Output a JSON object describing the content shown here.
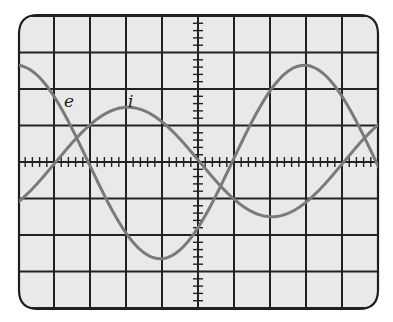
{
  "chart_data": {
    "type": "line",
    "title": "",
    "xlabel": "",
    "ylabel": "",
    "grid": true,
    "grid_divisions": {
      "x": 10,
      "y": 8
    },
    "xlim": [
      -5,
      5
    ],
    "ylim": [
      -4,
      4
    ],
    "units": "oscilloscope divisions",
    "annotations": [
      {
        "text": "e",
        "x": -3.5,
        "y": 1.6
      },
      {
        "text": "i",
        "x": -1.8,
        "y": 1.6
      }
    ],
    "series": [
      {
        "name": "e",
        "description": "voltage waveform, sinusoid",
        "amplitude_div": 2.65,
        "period_div": 8.0,
        "peak_x_div": 2.95,
        "points": [
          [
            -5.0,
            2.6
          ],
          [
            -4.0,
            1.85
          ],
          [
            -3.0,
            0.0
          ],
          [
            -2.0,
            -1.85
          ],
          [
            -1.05,
            -2.65
          ],
          [
            0.0,
            -1.85
          ],
          [
            1.0,
            0.0
          ],
          [
            2.0,
            1.85
          ],
          [
            2.95,
            2.65
          ],
          [
            4.0,
            1.85
          ],
          [
            5.0,
            0.0
          ]
        ],
        "color": "#7a7a7a"
      },
      {
        "name": "i",
        "description": "current waveform, sinusoid leading e by ~90°",
        "amplitude_div": 1.5,
        "period_div": 8.0,
        "peak_x_div": -1.95,
        "points": [
          [
            -5.0,
            -1.2
          ],
          [
            -4.0,
            0.0
          ],
          [
            -3.0,
            1.05
          ],
          [
            -1.95,
            1.5
          ],
          [
            -1.0,
            1.1
          ],
          [
            0.0,
            0.05
          ],
          [
            1.0,
            -1.05
          ],
          [
            2.1,
            -1.5
          ],
          [
            3.0,
            -1.1
          ],
          [
            4.0,
            0.0
          ],
          [
            5.0,
            1.05
          ]
        ],
        "color": "#7a7a7a"
      }
    ]
  },
  "screen": {
    "background": "#e9e9e9",
    "grid_color": "#222222",
    "trace_color": "#7a7a7a"
  },
  "labels": {
    "e": "e",
    "i": "i"
  }
}
